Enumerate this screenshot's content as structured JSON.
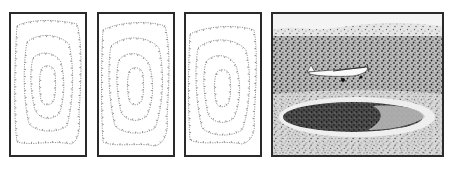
{
  "figure": {
    "panels": [
      {
        "id": "contour-map-1",
        "type": "contour-map",
        "contour_levels": 4
      },
      {
        "id": "contour-map-2",
        "type": "contour-map",
        "contour_levels": 4
      },
      {
        "id": "contour-map-3",
        "type": "contour-map",
        "contour_levels": 4
      },
      {
        "id": "crater-illustration",
        "type": "illustration",
        "subjects": [
          "impact crater",
          "airplane",
          "grassland"
        ]
      }
    ],
    "colors": {
      "frame": "#2a2a2a",
      "contour": "#8a8a8a",
      "background": "#ffffff",
      "ground_dark": "#3a3a3a",
      "ground_light": "#cfcfcf"
    }
  }
}
